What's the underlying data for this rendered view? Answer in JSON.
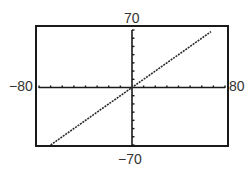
{
  "chart_data": {
    "type": "line",
    "title": "",
    "xlabel": "",
    "ylabel": "",
    "xlim": [
      -80,
      80
    ],
    "ylim": [
      -70,
      70
    ],
    "x_tick_step": 10,
    "y_tick_step": 10,
    "grid": false,
    "window_labels": {
      "xmin": "−80",
      "xmax": "80",
      "ymin": "−70",
      "ymax": "70"
    },
    "series": [
      {
        "name": "y = x",
        "style": "dotted-pixel",
        "x": [
          -70,
          68
        ],
        "y": [
          -70,
          68
        ]
      }
    ]
  },
  "colors": {
    "frame": "#1a1a1a",
    "axis": "#1a1a1a",
    "line": "#2a2a2a",
    "background": "#ffffff"
  }
}
